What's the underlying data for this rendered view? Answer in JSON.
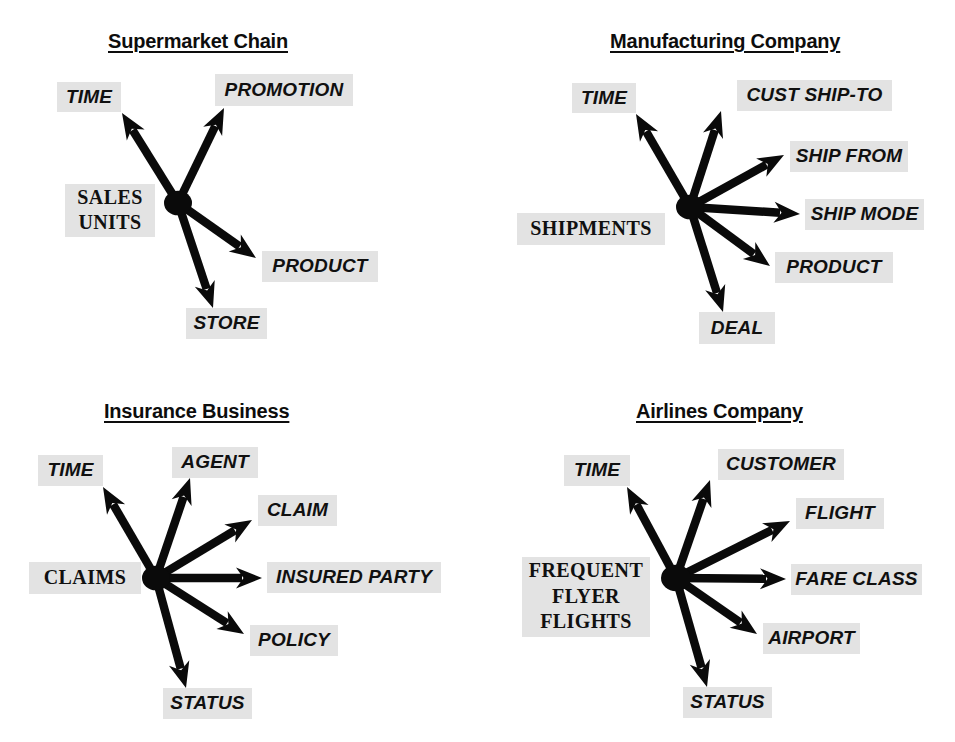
{
  "page": {
    "background": "#ffffff",
    "node_bg": "#e3e3e3",
    "ink": "#0a0a0a",
    "width": 955,
    "height": 742
  },
  "diagrams": [
    {
      "id": "supermarket-chain",
      "title": "Supermarket Chain",
      "title_pos": {
        "x": 108,
        "y": 30
      },
      "fact": {
        "label_lines": [
          "SALES",
          "UNITS"
        ],
        "label": "SALES UNITS",
        "box": {
          "x": 65,
          "y": 184,
          "w": 90,
          "h": 53
        }
      },
      "hub": {
        "x": 178,
        "y": 203,
        "r": 14
      },
      "dimensions": [
        {
          "label": "TIME",
          "box": {
            "x": 57,
            "y": 82,
            "w": 64,
            "h": 30
          },
          "tip": {
            "x": 122,
            "y": 113
          }
        },
        {
          "label": "PROMOTION",
          "box": {
            "x": 215,
            "y": 74,
            "w": 138,
            "h": 32
          },
          "tip": {
            "x": 224,
            "y": 108
          }
        },
        {
          "label": "PRODUCT",
          "box": {
            "x": 262,
            "y": 251,
            "w": 116,
            "h": 31
          },
          "tip": {
            "x": 256,
            "y": 258
          }
        },
        {
          "label": "STORE",
          "box": {
            "x": 186,
            "y": 308,
            "w": 81,
            "h": 31
          },
          "tip": {
            "x": 213,
            "y": 308
          }
        }
      ]
    },
    {
      "id": "manufacturing-company",
      "title": "Manufacturing Company",
      "title_pos": {
        "x": 610,
        "y": 30
      },
      "fact": {
        "label_lines": [
          "SHIPMENTS"
        ],
        "label": "SHIPMENTS",
        "box": {
          "x": 517,
          "y": 213,
          "w": 148,
          "h": 32
        }
      },
      "hub": {
        "x": 690,
        "y": 207,
        "r": 14
      },
      "dimensions": [
        {
          "label": "TIME",
          "box": {
            "x": 572,
            "y": 83,
            "w": 64,
            "h": 30
          },
          "tip": {
            "x": 636,
            "y": 114
          }
        },
        {
          "label": "CUST SHIP-TO",
          "box": {
            "x": 737,
            "y": 80,
            "w": 155,
            "h": 31
          },
          "tip": {
            "x": 721,
            "y": 111
          }
        },
        {
          "label": "SHIP FROM",
          "box": {
            "x": 790,
            "y": 141,
            "w": 118,
            "h": 31
          },
          "tip": {
            "x": 784,
            "y": 155
          }
        },
        {
          "label": "SHIP MODE",
          "box": {
            "x": 805,
            "y": 199,
            "w": 119,
            "h": 31
          },
          "tip": {
            "x": 800,
            "y": 214
          }
        },
        {
          "label": "PRODUCT",
          "box": {
            "x": 775,
            "y": 252,
            "w": 118,
            "h": 31
          },
          "tip": {
            "x": 770,
            "y": 266
          }
        },
        {
          "label": "DEAL",
          "box": {
            "x": 699,
            "y": 312,
            "w": 76,
            "h": 32
          },
          "tip": {
            "x": 723,
            "y": 312
          }
        }
      ]
    },
    {
      "id": "insurance-business",
      "title": "Insurance Business",
      "title_pos": {
        "x": 104,
        "y": 400
      },
      "fact": {
        "label_lines": [
          "CLAIMS"
        ],
        "label": "CLAIMS",
        "box": {
          "x": 29,
          "y": 562,
          "w": 112,
          "h": 32
        }
      },
      "hub": {
        "x": 156,
        "y": 578,
        "r": 14
      },
      "dimensions": [
        {
          "label": "TIME",
          "box": {
            "x": 38,
            "y": 455,
            "w": 65,
            "h": 31
          },
          "tip": {
            "x": 103,
            "y": 487
          }
        },
        {
          "label": "AGENT",
          "box": {
            "x": 172,
            "y": 447,
            "w": 86,
            "h": 31
          },
          "tip": {
            "x": 190,
            "y": 478
          }
        },
        {
          "label": "CLAIM",
          "box": {
            "x": 258,
            "y": 495,
            "w": 79,
            "h": 31
          },
          "tip": {
            "x": 252,
            "y": 520
          }
        },
        {
          "label": "INSURED PARTY",
          "box": {
            "x": 267,
            "y": 562,
            "w": 174,
            "h": 31
          },
          "tip": {
            "x": 262,
            "y": 578
          }
        },
        {
          "label": "POLICY",
          "box": {
            "x": 250,
            "y": 625,
            "w": 88,
            "h": 31
          },
          "tip": {
            "x": 244,
            "y": 634
          }
        },
        {
          "label": "STATUS",
          "box": {
            "x": 163,
            "y": 688,
            "w": 89,
            "h": 31
          },
          "tip": {
            "x": 186,
            "y": 688
          }
        }
      ]
    },
    {
      "id": "airlines-company",
      "title": "Airlines Company",
      "title_pos": {
        "x": 636,
        "y": 400
      },
      "fact": {
        "label_lines": [
          "FREQUENT",
          "FLYER",
          "FLIGHTS"
        ],
        "label": "FREQUENT FLYER FLIGHTS",
        "box": {
          "x": 522,
          "y": 557,
          "w": 128,
          "h": 80
        }
      },
      "hub": {
        "x": 676,
        "y": 578,
        "r": 15
      },
      "dimensions": [
        {
          "label": "TIME",
          "box": {
            "x": 564,
            "y": 455,
            "w": 66,
            "h": 31
          },
          "tip": {
            "x": 627,
            "y": 487
          }
        },
        {
          "label": "CUSTOMER",
          "box": {
            "x": 718,
            "y": 449,
            "w": 126,
            "h": 31
          },
          "tip": {
            "x": 710,
            "y": 480
          }
        },
        {
          "label": "FLIGHT",
          "box": {
            "x": 796,
            "y": 498,
            "w": 88,
            "h": 31
          },
          "tip": {
            "x": 790,
            "y": 521
          }
        },
        {
          "label": "FARE CLASS",
          "box": {
            "x": 791,
            "y": 564,
            "w": 131,
            "h": 31
          },
          "tip": {
            "x": 786,
            "y": 579
          }
        },
        {
          "label": "AIRPORT",
          "box": {
            "x": 763,
            "y": 623,
            "w": 97,
            "h": 31
          },
          "tip": {
            "x": 757,
            "y": 634
          }
        },
        {
          "label": "STATUS",
          "box": {
            "x": 683,
            "y": 687,
            "w": 89,
            "h": 31
          },
          "tip": {
            "x": 707,
            "y": 687
          }
        }
      ]
    }
  ]
}
